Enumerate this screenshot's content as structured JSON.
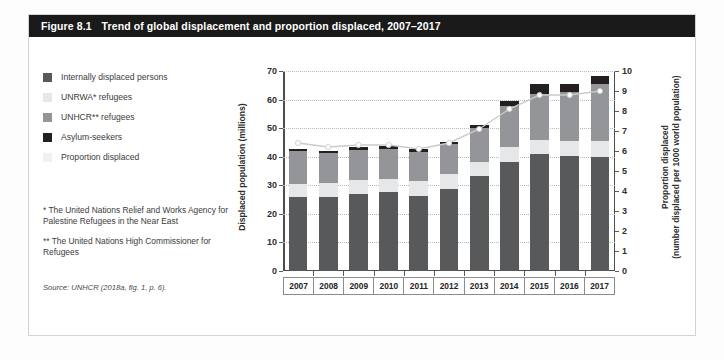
{
  "figure": {
    "number": "Figure 8.1",
    "title": "Trend of global displacement and proportion displaced, 2007–2017"
  },
  "legend": {
    "items": [
      {
        "label": "Internally displaced persons",
        "color": "#58595b",
        "key": "idp"
      },
      {
        "label": "UNRWA* refugees",
        "color": "#e6e7e8",
        "key": "unrwa"
      },
      {
        "label": "UNHCR** refugees",
        "color": "#939598",
        "key": "unhcr"
      },
      {
        "label": "Asylum-seekers",
        "color": "#231f20",
        "key": "asylum"
      },
      {
        "label": "Proportion displaced",
        "color": "#f1f1f2",
        "key": "proportion"
      }
    ]
  },
  "notes": [
    "* The United Nations Relief and Works Agency for Palestine Refugees in the Near East",
    "** The United Nations High Commissioner for Refugees"
  ],
  "source": "Source: UNHCR (2018a, fig. 1, p. 6).",
  "chart_data": {
    "type": "bar",
    "title": "Trend of global displacement and proportion displaced, 2007–2017",
    "xlabel": "",
    "ylabel": "Displaced population (millions)",
    "y2label": "Proportion displaced (number displaced per 1000 world population)",
    "ylim": [
      0,
      70
    ],
    "y2lim": [
      0,
      10
    ],
    "yticks": [
      0,
      10,
      20,
      30,
      40,
      50,
      60,
      70
    ],
    "y2ticks": [
      0,
      1,
      2,
      3,
      4,
      5,
      6,
      7,
      8,
      9,
      10
    ],
    "grid": true,
    "legend_position": "left-outside",
    "stacked": true,
    "categories": [
      "2007",
      "2008",
      "2009",
      "2010",
      "2011",
      "2012",
      "2013",
      "2014",
      "2015",
      "2016",
      "2017"
    ],
    "series": [
      {
        "name": "Internally displaced persons",
        "color": "#58595b",
        "values": [
          25.9,
          26.0,
          27.1,
          27.5,
          26.4,
          28.8,
          33.3,
          38.2,
          40.8,
          40.3,
          40.0
        ]
      },
      {
        "name": "UNRWA* refugees",
        "color": "#e6e7e8",
        "values": [
          4.6,
          4.7,
          4.8,
          4.8,
          5.0,
          5.0,
          5.0,
          5.1,
          5.2,
          5.3,
          5.4
        ]
      },
      {
        "name": "UNHCR** refugees",
        "color": "#939598",
        "values": [
          11.4,
          10.5,
          10.4,
          10.5,
          10.4,
          10.5,
          11.7,
          14.4,
          16.1,
          17.2,
          19.9
        ]
      },
      {
        "name": "Asylum-seekers",
        "color": "#231f20",
        "values": [
          0.7,
          0.8,
          1.0,
          0.8,
          0.9,
          0.9,
          1.2,
          1.8,
          3.2,
          2.8,
          3.1
        ]
      }
    ],
    "totals": [
      42.6,
      42.0,
      43.3,
      43.6,
      42.7,
      45.2,
      51.2,
      59.5,
      65.3,
      65.6,
      68.4
    ],
    "line_series": {
      "name": "Proportion displaced",
      "unit": "per 1000 world population",
      "axis": "right",
      "color": "#c9cacb",
      "marker_color": "#ffffff",
      "values": [
        6.4,
        6.2,
        6.3,
        6.3,
        6.1,
        6.4,
        7.1,
        8.1,
        8.8,
        8.8,
        9.0
      ]
    }
  }
}
